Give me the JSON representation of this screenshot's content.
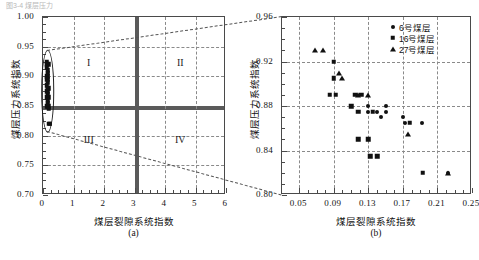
{
  "figure": {
    "top_fragment": "图3-4  煤层压力"
  },
  "panel_a": {
    "label": "(a)",
    "xlabel": "煤层裂隙系统指数",
    "ylabel": "煤层压力系统指数",
    "xticks": [
      "0",
      "1",
      "2",
      "3",
      "4",
      "5",
      "6"
    ],
    "yticks": [
      "0.70",
      "0.75",
      "0.80",
      "0.85",
      "0.90",
      "0.95",
      "1.00"
    ],
    "quadrants": [
      "I",
      "II",
      "III",
      "IV"
    ]
  },
  "panel_b": {
    "label": "(b)",
    "xlabel": "煤层裂隙系统指数",
    "ylabel": "煤层压力系统指数",
    "xticks": [
      "0.05",
      "0.09",
      "0.13",
      "0.17",
      "0.21",
      "0.25"
    ],
    "yticks": [
      "0.80",
      "0.84",
      "0.88",
      "0.92",
      "0.96"
    ],
    "legend": [
      {
        "marker": "circle-marker",
        "label": "6号煤层"
      },
      {
        "marker": "square-marker",
        "label": "16号煤层"
      },
      {
        "marker": "triangle-marker",
        "label": "27号煤层"
      }
    ]
  },
  "chart_data": [
    {
      "type": "scatter",
      "id": "panel-a",
      "title": "(a)",
      "xlabel": "煤层裂隙系统指数",
      "ylabel": "煤层压力系统指数",
      "xlim": [
        0,
        6
      ],
      "ylim": [
        0.7,
        1.0
      ],
      "xticks": [
        0,
        1,
        2,
        3,
        4,
        5,
        6
      ],
      "yticks": [
        0.7,
        0.75,
        0.8,
        0.85,
        0.9,
        0.95,
        1.0
      ],
      "grid": true,
      "grid_style": "dashed",
      "reference_lines": {
        "x": 3,
        "y": 0.85
      },
      "annotations": [
        {
          "text": "I",
          "x": 1.5,
          "y": 0.925
        },
        {
          "text": "II",
          "x": 4.5,
          "y": 0.925
        },
        {
          "text": "III",
          "x": 1.5,
          "y": 0.795
        },
        {
          "text": "IV",
          "x": 4.5,
          "y": 0.795
        }
      ],
      "highlight_ellipse": {
        "cx": 0.16,
        "cy": 0.875,
        "rx": 0.19,
        "ry": 0.068
      },
      "series": [
        {
          "name": "全部样本聚集区",
          "marker": "square",
          "points": [
            [
              0.12,
              0.925
            ],
            [
              0.13,
              0.92
            ],
            [
              0.17,
              0.92
            ],
            [
              0.13,
              0.915
            ],
            [
              0.15,
              0.91
            ],
            [
              0.15,
              0.905
            ],
            [
              0.13,
              0.9
            ],
            [
              0.16,
              0.9
            ],
            [
              0.14,
              0.895
            ],
            [
              0.16,
              0.89
            ],
            [
              0.13,
              0.885
            ],
            [
              0.15,
              0.88
            ],
            [
              0.17,
              0.88
            ],
            [
              0.14,
              0.875
            ],
            [
              0.16,
              0.87
            ],
            [
              0.13,
              0.865
            ],
            [
              0.17,
              0.865
            ],
            [
              0.15,
              0.86
            ],
            [
              0.16,
              0.855
            ],
            [
              0.14,
              0.85
            ],
            [
              0.18,
              0.85
            ],
            [
              0.19,
              0.845
            ],
            [
              0.21,
              0.82
            ],
            [
              0.22,
              0.82
            ]
          ]
        }
      ]
    },
    {
      "type": "scatter",
      "id": "panel-b",
      "title": "(b)",
      "xlabel": "煤层裂隙系统指数",
      "ylabel": "煤层压力系统指数",
      "xlim": [
        0.03,
        0.25
      ],
      "ylim": [
        0.8,
        0.96
      ],
      "xticks": [
        0.05,
        0.09,
        0.13,
        0.17,
        0.21,
        0.25
      ],
      "yticks": [
        0.8,
        0.84,
        0.88,
        0.92,
        0.96
      ],
      "grid": true,
      "grid_style": "dashed",
      "legend_position": "top-right",
      "series": [
        {
          "name": "6号煤层",
          "marker": "circle",
          "points": [
            [
              0.13,
              0.88
            ],
            [
              0.15,
              0.88
            ],
            [
              0.13,
              0.875
            ],
            [
              0.14,
              0.875
            ],
            [
              0.15,
              0.875
            ],
            [
              0.145,
              0.87
            ],
            [
              0.17,
              0.87
            ],
            [
              0.172,
              0.865
            ],
            [
              0.192,
              0.865
            ],
            [
              0.222,
              0.82
            ]
          ]
        },
        {
          "name": "16号煤层",
          "marker": "square",
          "points": [
            [
              0.09,
              0.92
            ],
            [
              0.09,
              0.905
            ],
            [
              0.085,
              0.89
            ],
            [
              0.092,
              0.89
            ],
            [
              0.115,
              0.89
            ],
            [
              0.122,
              0.89
            ],
            [
              0.11,
              0.88
            ],
            [
              0.118,
              0.875
            ],
            [
              0.135,
              0.875
            ],
            [
              0.178,
              0.865
            ],
            [
              0.118,
              0.85
            ],
            [
              0.13,
              0.85
            ],
            [
              0.132,
              0.835
            ],
            [
              0.14,
              0.835
            ],
            [
              0.193,
              0.82
            ]
          ]
        },
        {
          "name": "27号煤层",
          "marker": "triangle",
          "points": [
            [
              0.068,
              0.93
            ],
            [
              0.078,
              0.93
            ],
            [
              0.096,
              0.91
            ],
            [
              0.1,
              0.905
            ],
            [
              0.118,
              0.89
            ],
            [
              0.13,
              0.89
            ],
            [
              0.176,
              0.855
            ],
            [
              0.222,
              0.82
            ]
          ]
        }
      ]
    }
  ]
}
